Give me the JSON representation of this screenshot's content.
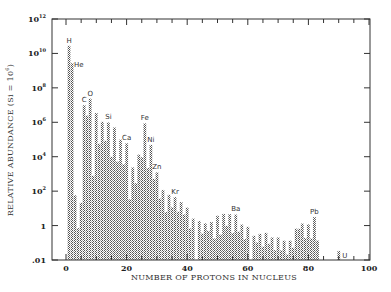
{
  "chart_data": {
    "type": "bar",
    "title": "",
    "xlabel": "NUMBER OF PROTONS IN NUCLEUS",
    "ylabel": "RELATIVE ABUNDANCE (Si = 10^6)",
    "yscale": "log",
    "ylim": [
      0.01,
      1000000000000.0
    ],
    "xlim": [
      -5,
      100
    ],
    "grid": false,
    "legend": null,
    "x_ticks": [
      0,
      20,
      40,
      60,
      80,
      100
    ],
    "y_ticks": [
      {
        "value": 1000000000000.0,
        "label": "10",
        "exp": "12"
      },
      {
        "value": 10000000000.0,
        "label": "10",
        "exp": "10"
      },
      {
        "value": 100000000.0,
        "label": "10",
        "exp": "8"
      },
      {
        "value": 1000000.0,
        "label": "10",
        "exp": "6"
      },
      {
        "value": 10000.0,
        "label": "10",
        "exp": "4"
      },
      {
        "value": 100.0,
        "label": "10",
        "exp": "2"
      },
      {
        "value": 1,
        "label": "1",
        "exp": ""
      },
      {
        "value": 0.01,
        "label": ".01",
        "exp": ""
      }
    ],
    "series_note": "values are log10(abundance), Si = 10^6",
    "x": [
      1,
      2,
      3,
      4,
      5,
      6,
      7,
      8,
      9,
      10,
      11,
      12,
      13,
      14,
      15,
      16,
      17,
      18,
      19,
      20,
      21,
      22,
      23,
      24,
      25,
      26,
      27,
      28,
      29,
      30,
      31,
      32,
      33,
      34,
      35,
      36,
      37,
      38,
      39,
      40,
      41,
      42,
      44,
      45,
      46,
      47,
      48,
      49,
      50,
      51,
      52,
      53,
      54,
      55,
      56,
      57,
      58,
      59,
      60,
      62,
      63,
      64,
      65,
      66,
      67,
      68,
      69,
      70,
      71,
      72,
      73,
      74,
      75,
      76,
      77,
      78,
      79,
      80,
      81,
      82,
      83,
      90,
      92
    ],
    "log10_values": [
      10.45,
      9.44,
      1.77,
      -0.14,
      1.32,
      7.0,
      6.4,
      7.38,
      2.9,
      6.54,
      4.76,
      6.03,
      4.93,
      6.0,
      4.0,
      5.71,
      3.72,
      5.0,
      3.57,
      4.79,
      1.53,
      3.39,
      2.47,
      4.13,
      3.98,
      5.95,
      3.35,
      4.69,
      2.72,
      3.1,
      1.58,
      2.07,
      0.79,
      1.79,
      1.07,
      1.66,
      0.81,
      1.37,
      0.66,
      1.05,
      -0.15,
      0.41,
      0.27,
      -0.46,
      0.14,
      -0.31,
      0.21,
      -0.74,
      0.58,
      -0.52,
      0.68,
      -0.01,
      0.67,
      -0.43,
      0.65,
      -0.35,
      0.07,
      -0.78,
      -0.07,
      -0.59,
      -0.97,
      -0.48,
      -1.22,
      -0.42,
      -1.05,
      -0.68,
      -1.42,
      -0.68,
      -1.43,
      -0.87,
      -1.67,
      -0.87,
      -1.28,
      -0.17,
      -0.18,
      0.13,
      -0.72,
      0.08,
      -0.74,
      0.5,
      -0.86,
      -1.47,
      -2.04
    ],
    "annotations": [
      {
        "text": "H",
        "x": 1
      },
      {
        "text": "He",
        "x": 2
      },
      {
        "text": "C",
        "x": 6
      },
      {
        "text": "O",
        "x": 8
      },
      {
        "text": "Si",
        "x": 14
      },
      {
        "text": "Ca",
        "x": 20
      },
      {
        "text": "Fe",
        "x": 26
      },
      {
        "text": "Ni",
        "x": 28
      },
      {
        "text": "Zn",
        "x": 30
      },
      {
        "text": "Kr",
        "x": 36
      },
      {
        "text": "Ba",
        "x": 56
      },
      {
        "text": "Pb",
        "x": 82
      },
      {
        "text": "U",
        "x": 92
      }
    ]
  }
}
